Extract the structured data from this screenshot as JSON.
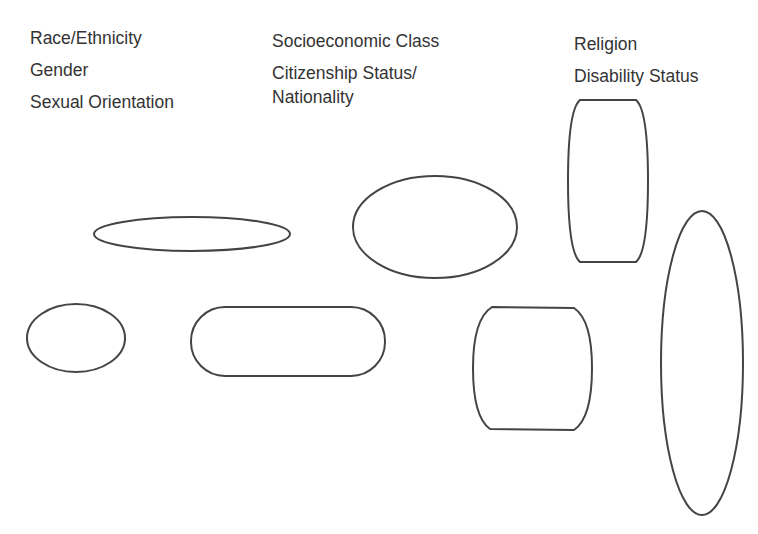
{
  "labels": {
    "col1": [
      "Race/Ethnicity",
      "Gender",
      "Sexual Orientation"
    ],
    "col2": [
      "Socioeconomic Class",
      "Citizenship Status/",
      "Nationality"
    ],
    "col3": [
      "Religion",
      "Disability Status"
    ]
  },
  "shapes": [
    {
      "name": "flat-ellipse",
      "type": "ellipse"
    },
    {
      "name": "large-ellipse",
      "type": "ellipse"
    },
    {
      "name": "tall-barrel",
      "type": "barrel"
    },
    {
      "name": "small-ellipse",
      "type": "ellipse"
    },
    {
      "name": "pill",
      "type": "rounded-rect"
    },
    {
      "name": "square-barrel",
      "type": "barrel"
    },
    {
      "name": "tall-ellipse",
      "type": "ellipse"
    }
  ],
  "colors": {
    "stroke": "#444444",
    "text": "#333333",
    "background": "#ffffff"
  }
}
